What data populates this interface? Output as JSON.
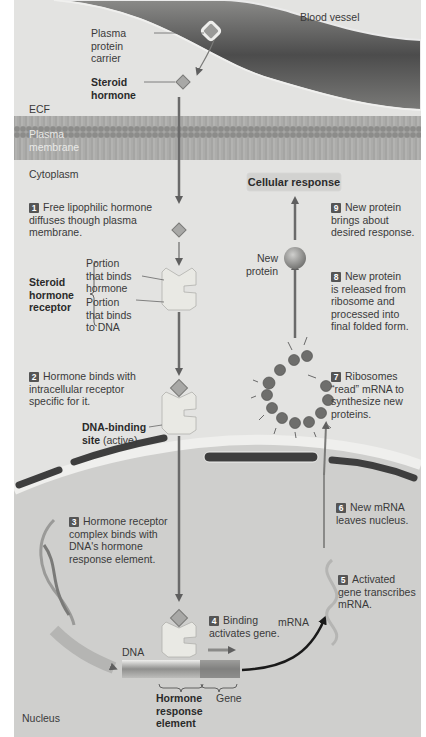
{
  "diagram": {
    "title_regions": {
      "blood_vessel": "Blood vessel",
      "ecf": "ECF",
      "plasma_membrane_1": "Plasma",
      "plasma_membrane_2": "membrane",
      "cytoplasm": "Cytoplasm",
      "nucleus": "Nucleus"
    },
    "labels": {
      "carrier_1": "Plasma",
      "carrier_2": "protein",
      "carrier_3": "carrier",
      "steroid_1": "Steroid",
      "steroid_2": "hormone",
      "receptor_1": "Steroid",
      "receptor_2": "hormone",
      "receptor_3": "receptor",
      "portion_h_1": "Portion",
      "portion_h_2": "that binds",
      "portion_h_3": "hormone",
      "portion_d_1": "Portion",
      "portion_d_2": "that binds",
      "portion_d_3": "to DNA",
      "dna_site_bold": "DNA-binding",
      "dna_site_bold2": "site",
      "dna_site_rest": " (active)",
      "new_protein_1": "New",
      "new_protein_2": "protein",
      "cellular_response": "Cellular response",
      "mrna": "mRNA",
      "dna": "DNA",
      "hre_1": "Hormone",
      "hre_2": "response",
      "hre_3": "element",
      "gene": "Gene"
    },
    "steps": [
      {
        "n": "1",
        "lines": [
          "Free lipophilic hormone",
          "diffuses though plasma",
          "membrane."
        ]
      },
      {
        "n": "2",
        "lines": [
          "Hormone binds with",
          "intracellular receptor",
          "specific for it."
        ]
      },
      {
        "n": "3",
        "lines": [
          "Hormone receptor",
          "complex binds with",
          "DNA's hormone",
          "response element."
        ]
      },
      {
        "n": "4",
        "lines": [
          "Binding",
          "activates gene."
        ]
      },
      {
        "n": "5",
        "lines": [
          "Activated",
          "gene transcribes",
          "mRNA."
        ]
      },
      {
        "n": "6",
        "lines": [
          "New mRNA",
          "leaves nucleus."
        ]
      },
      {
        "n": "7",
        "lines": [
          "Ribosomes",
          "“read” mRNA to",
          "synthesize new",
          "proteins."
        ]
      },
      {
        "n": "8",
        "lines": [
          "New protein",
          "is released from",
          "ribosome and",
          "processed into",
          "final folded form."
        ]
      },
      {
        "n": "9",
        "lines": [
          "New protein",
          "brings about",
          "desired response."
        ]
      }
    ],
    "colors": {
      "background": "#e3e3e1",
      "vessel": "#5a5a5a",
      "membrane": "#9a9a98",
      "nucleus": "#cfcfcd",
      "arrow": "#666666",
      "hormone": "#b9b9b7"
    }
  }
}
